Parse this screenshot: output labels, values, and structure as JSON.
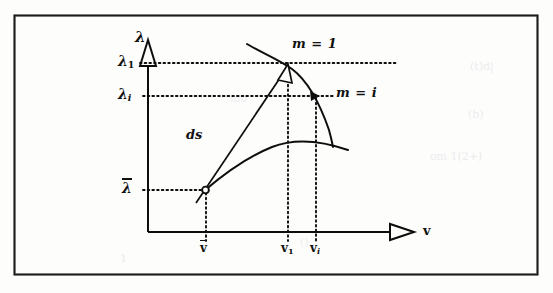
{
  "figure": {
    "kind": "line-diagram",
    "background_color": "#fdfdfc",
    "ink_color": "#111111",
    "frame": {
      "x": 14,
      "y": 15,
      "width": 524,
      "height": 260
    }
  },
  "axes": {
    "y_axis_label": "λ",
    "x_axis_label": "v",
    "y_ticks": [
      {
        "id": "lambda1",
        "base": "λ",
        "subscript": "1",
        "overbar": false,
        "value_y": 63
      },
      {
        "id": "lambdai",
        "base": "λ",
        "subscript": "i",
        "overbar": false,
        "value_y": 96
      },
      {
        "id": "lambdabar",
        "base": "λ",
        "subscript": "",
        "overbar": true,
        "value_y": 190
      }
    ],
    "x_ticks": [
      {
        "id": "vbar",
        "base": "v",
        "subscript": "",
        "overbar": true,
        "value_x": 206
      },
      {
        "id": "v1",
        "base": "v",
        "subscript": "1",
        "overbar": false,
        "value_x": 288
      },
      {
        "id": "vi",
        "base": "v",
        "subscript": "i",
        "overbar": false,
        "value_x": 316
      }
    ],
    "origin": {
      "x": 148,
      "y": 232
    },
    "y_axis_top": {
      "x": 148,
      "y": 45
    },
    "x_axis_right": {
      "x": 415,
      "y": 232
    }
  },
  "annotations": {
    "curve_m1_label": "m = 1",
    "curve_mi_label": "m = i",
    "vector_label": "ds"
  },
  "curves": [
    {
      "name": "m = 1",
      "label": "m = 1",
      "label_position": {
        "x": 294,
        "y": 44
      },
      "path": "M 248,45 C 268,58 286,68 302,85 C 316,100 326,124 332,146",
      "marker_point": {
        "x": 289,
        "y": 64
      }
    },
    {
      "name": "m = i",
      "label": "m = i",
      "label_position": {
        "x": 337,
        "y": 92
      },
      "path": "M 204,190 C 225,172 252,152 283,142 C 305,136 330,142 349,150",
      "marker_point": {
        "x": 317,
        "y": 96
      }
    }
  ],
  "vector": {
    "label": "ds",
    "label_position": {
      "x": 188,
      "y": 135
    },
    "from": {
      "x": 203,
      "y": 192
    },
    "to": {
      "x": 288,
      "y": 65
    }
  },
  "markers": [
    {
      "id": "start-point",
      "shape": "circle-open",
      "x": 205,
      "y": 190
    },
    {
      "id": "m1-intersection",
      "shape": "arrowhead",
      "x": 288,
      "y": 65
    },
    {
      "id": "mi-intersection",
      "shape": "arrowhead",
      "x": 317,
      "y": 96
    }
  ],
  "guide_lines": [
    {
      "id": "lambda1-horizontal",
      "style": "dotted",
      "x1": 148,
      "y1": 63,
      "x2": 396,
      "y2": 63
    },
    {
      "id": "lambdai-horizontal",
      "style": "dotted",
      "x1": 148,
      "y1": 96,
      "x2": 334,
      "y2": 96
    },
    {
      "id": "lambdabar-horizontal",
      "style": "dotted",
      "x1": 148,
      "y1": 190,
      "x2": 204,
      "y2": 190
    },
    {
      "id": "vbar-vertical",
      "style": "dotted",
      "x1": 206,
      "y1": 192,
      "x2": 206,
      "y2": 240
    },
    {
      "id": "v1-vertical",
      "style": "dotted",
      "x1": 288,
      "y1": 66,
      "x2": 288,
      "y2": 240
    },
    {
      "id": "vi-vertical",
      "style": "dotted",
      "x1": 316,
      "y1": 97,
      "x2": 316,
      "y2": 240
    }
  ],
  "ghost_marks": [
    {
      "text": "(t)d|",
      "x": 470,
      "y": 60
    },
    {
      "text": "(b)",
      "x": 468,
      "y": 108
    },
    {
      "text": "om 1(2+)",
      "x": 430,
      "y": 150
    },
    {
      "text": "mo",
      "x": 230,
      "y": 92
    },
    {
      "text": "()",
      "x": 300,
      "y": 236
    },
    {
      "text": "1",
      "x": 120,
      "y": 252
    }
  ]
}
